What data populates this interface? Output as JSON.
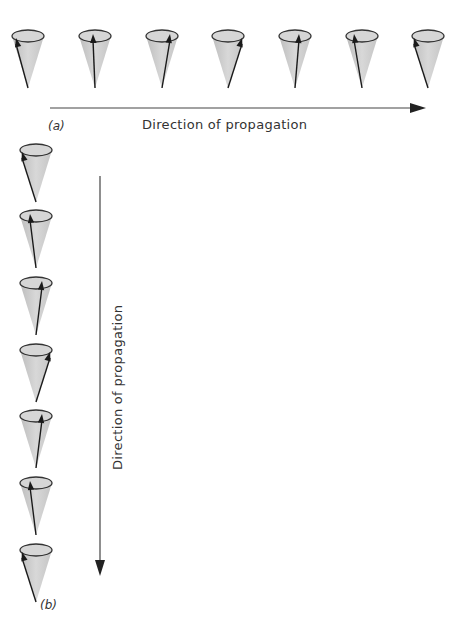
{
  "figure": {
    "panel_a": {
      "label": "(a)",
      "axis_label": "Direction of propagation",
      "cones": [
        {
          "cx": 28,
          "tilt": -12
        },
        {
          "cx": 95,
          "tilt": -2
        },
        {
          "cx": 162,
          "tilt": 8
        },
        {
          "cx": 228,
          "tilt": 14
        },
        {
          "cx": 295,
          "tilt": 4
        },
        {
          "cx": 362,
          "tilt": -8
        },
        {
          "cx": 428,
          "tilt": -14
        }
      ]
    },
    "panel_b": {
      "label": "(b)",
      "axis_label": "Direction of propagation",
      "cones": [
        {
          "cy": 150,
          "tilt": -14
        },
        {
          "cy": 216,
          "tilt": -6
        },
        {
          "cy": 283,
          "tilt": 6
        },
        {
          "cy": 350,
          "tilt": 14
        },
        {
          "cy": 416,
          "tilt": 6
        },
        {
          "cy": 483,
          "tilt": -6
        },
        {
          "cy": 550,
          "tilt": -14
        }
      ]
    },
    "colors": {
      "cone_fill": "#c9c9c9",
      "cone_rim": "#333333",
      "arrow": "#1a1a1a"
    }
  }
}
